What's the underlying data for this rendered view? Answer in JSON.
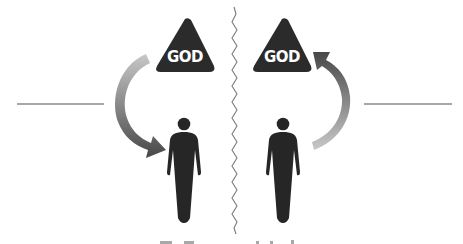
{
  "diagram": {
    "left_panel": {
      "triangle_label": "GOD",
      "arrow_direction": "down",
      "arrow_meaning": "from God to person"
    },
    "right_panel": {
      "triangle_label": "GOD",
      "arrow_direction": "up",
      "arrow_meaning": "from person to God"
    },
    "divider": "zigzag-line",
    "colors": {
      "triangle": "#2b2b2b",
      "figure": "#262626",
      "arrow_dark": "#4a4a4a",
      "arrow_light": "#c4c4c4",
      "rule_line": "#8a8a8a",
      "divider": "#7a7a7a",
      "background": "#ffffff"
    }
  }
}
